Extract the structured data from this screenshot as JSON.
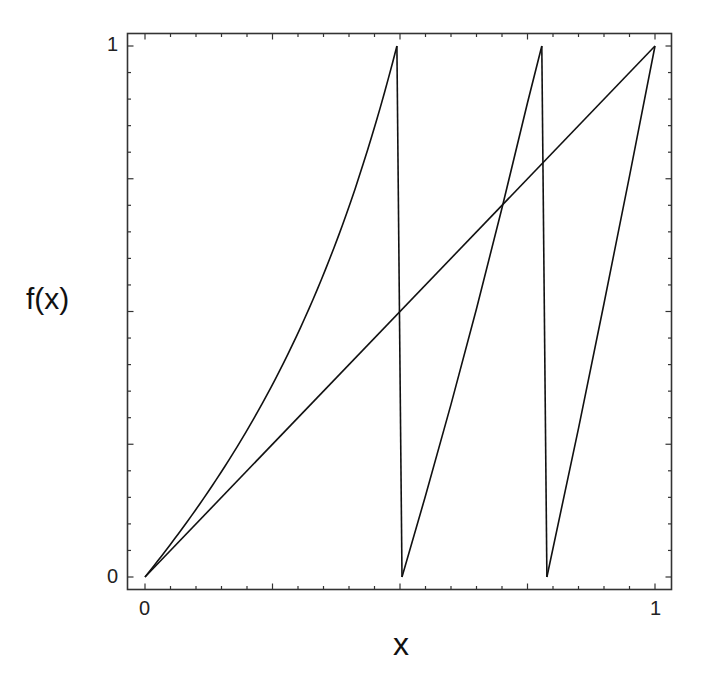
{
  "chart_data": {
    "type": "line",
    "title": "",
    "xlabel": "x",
    "ylabel": "f(x)",
    "xlim": [
      0,
      1
    ],
    "ylim": [
      0,
      1
    ],
    "grid": false,
    "legend": null,
    "x_tick_labels": [
      "0",
      "1"
    ],
    "y_tick_labels": [
      "0",
      "1"
    ],
    "minor_tick_step": 0.05,
    "major_tick_step": 0.25,
    "series": [
      {
        "name": "identity",
        "points": [
          [
            0,
            0
          ],
          [
            1,
            1
          ]
        ]
      },
      {
        "name": "branch-1",
        "points": [
          [
            0,
            0
          ],
          [
            0.05,
            0.062
          ],
          [
            0.1,
            0.13
          ],
          [
            0.15,
            0.205
          ],
          [
            0.2,
            0.285
          ],
          [
            0.25,
            0.372
          ],
          [
            0.3,
            0.466
          ],
          [
            0.35,
            0.569
          ],
          [
            0.4,
            0.68
          ],
          [
            0.45,
            0.8
          ],
          [
            0.494,
            1.0
          ]
        ]
      },
      {
        "name": "drop-1",
        "points": [
          [
            0.494,
            1.0
          ],
          [
            0.504,
            0.0
          ]
        ]
      },
      {
        "name": "branch-2",
        "points": [
          [
            0.504,
            0
          ],
          [
            0.55,
            0.153
          ],
          [
            0.6,
            0.325
          ],
          [
            0.65,
            0.505
          ],
          [
            0.7,
            0.695
          ],
          [
            0.75,
            0.893
          ],
          [
            0.778,
            1.0
          ]
        ]
      },
      {
        "name": "drop-2",
        "points": [
          [
            0.778,
            1.0
          ],
          [
            0.788,
            0.0
          ]
        ]
      },
      {
        "name": "branch-3",
        "points": [
          [
            0.788,
            0
          ],
          [
            0.85,
            0.28
          ],
          [
            0.9,
            0.515
          ],
          [
            0.95,
            0.755
          ],
          [
            1.0,
            1.0
          ]
        ]
      }
    ]
  },
  "axes": {
    "x_label": "x",
    "y_label": "f(x)",
    "x_min_label": "0",
    "x_max_label": "1",
    "y_min_label": "0",
    "y_max_label": "1"
  }
}
